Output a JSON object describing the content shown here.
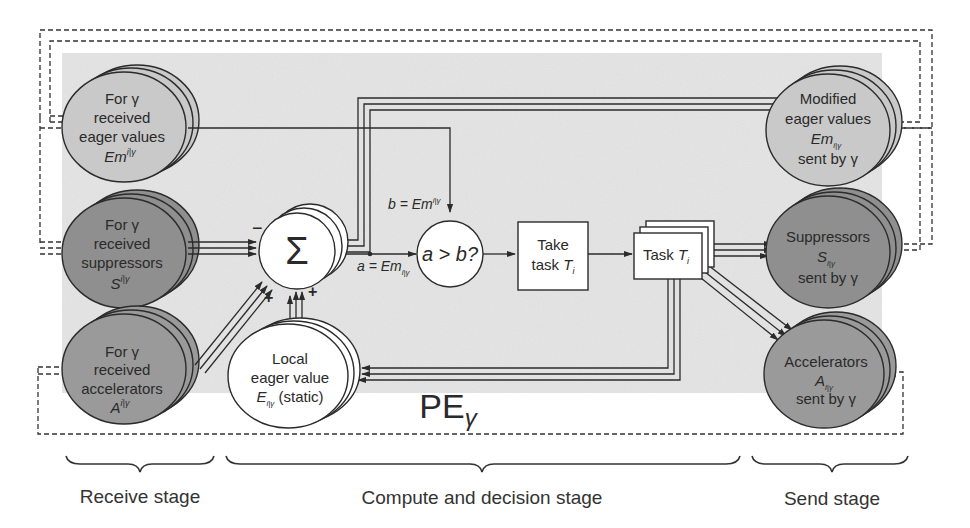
{
  "diagram": {
    "title": "PE",
    "title_sub": "γ",
    "colors": {
      "panel_bg": "#e4e4e4",
      "light_node": "#c9c9c9",
      "dark_node": "#8f8f8f",
      "medium_node": "#9f9f9f",
      "white_node": "#ffffff",
      "stroke": "#2b2b2b"
    },
    "receive_nodes": [
      {
        "id": "received-eager",
        "lines": [
          "For γ",
          "received",
          "eager values"
        ],
        "math_base": "Em",
        "math_sup": "i|γ"
      },
      {
        "id": "received-suppressors",
        "lines": [
          "For γ",
          "received",
          "suppressors"
        ],
        "math_base": "S",
        "math_sup": "i|γ"
      },
      {
        "id": "received-accelerators",
        "lines": [
          "For γ",
          "received",
          "accelerators"
        ],
        "math_base": "A",
        "math_sup": "i|γ"
      }
    ],
    "compute": {
      "sum_symbol": "Σ",
      "minus_sign": "−",
      "plus_sign": "+",
      "a_label_prefix": "a = Em",
      "a_label_sub": "i|γ",
      "b_label_prefix": "b = Em",
      "b_label_sup": "i|γ",
      "compare_label": "a > b?",
      "take_task_lines": [
        "Take",
        "task"
      ],
      "take_task_var": "T",
      "take_task_sub": "i",
      "task_label": "Task",
      "task_var": "T",
      "task_sub": "i",
      "local_lines": [
        "Local",
        "eager value"
      ],
      "local_math_base": "E",
      "local_math_sub": "i|γ",
      "local_suffix": "(static)"
    },
    "send_nodes": [
      {
        "id": "modified-eager",
        "lines": [
          "Modified",
          "eager values"
        ],
        "math_base": "Em",
        "math_sub": "i|γ",
        "last": "sent by γ"
      },
      {
        "id": "suppressors-sent",
        "lines": [
          "Suppressors"
        ],
        "math_base": "S",
        "math_sub": "i|γ",
        "last": "sent by γ"
      },
      {
        "id": "accelerators-sent",
        "lines": [
          "Accelerators"
        ],
        "math_base": "A",
        "math_sub": "i|γ",
        "last": "sent by γ"
      }
    ],
    "stages": [
      {
        "label": "Receive stage"
      },
      {
        "label": "Compute and decision stage"
      },
      {
        "label": "Send stage"
      }
    ]
  }
}
